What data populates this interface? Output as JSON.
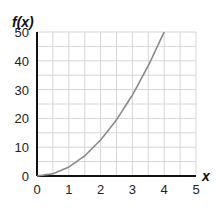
{
  "chart_data": {
    "type": "line",
    "title": "",
    "xlabel": "x",
    "ylabel": "f(x)",
    "xlim": [
      0,
      5
    ],
    "ylim": [
      0,
      50
    ],
    "x_ticks": [
      "0",
      "1",
      "2",
      "3",
      "4",
      "5"
    ],
    "y_ticks": [
      "0",
      "10",
      "20",
      "30",
      "40",
      "50"
    ],
    "grid": true,
    "series": [
      {
        "name": "f(x)",
        "x": [
          0,
          0.5,
          1,
          1.5,
          2,
          2.5,
          3,
          3.5,
          4
        ],
        "values": [
          0,
          0.8,
          3.1,
          7.0,
          12.5,
          19.5,
          28.1,
          38.3,
          50
        ]
      }
    ]
  }
}
